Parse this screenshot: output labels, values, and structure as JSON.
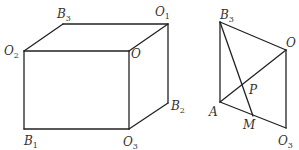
{
  "figures": [
    {
      "name": "cuboid",
      "vertices": {
        "O2": [
          24,
          51
        ],
        "B3": [
          63,
          24
        ],
        "O1": [
          168,
          24
        ],
        "O": [
          129,
          51
        ],
        "B1": [
          24,
          129
        ],
        "O3": [
          129,
          129
        ],
        "B2": [
          168,
          103
        ]
      },
      "edges": [
        [
          "O2",
          "B3"
        ],
        [
          "B3",
          "O1"
        ],
        [
          "O1",
          "O"
        ],
        [
          "O",
          "O2"
        ],
        [
          "O2",
          "B1"
        ],
        [
          "B1",
          "O3"
        ],
        [
          "O3",
          "O"
        ],
        [
          "O1",
          "B2"
        ],
        [
          "B2",
          "O3"
        ]
      ],
      "labels": [
        {
          "id": "O2",
          "base": "O",
          "sub": "2",
          "x": 4,
          "y": 55
        },
        {
          "id": "B3",
          "base": "B",
          "sub": "3",
          "x": 57,
          "y": 18
        },
        {
          "id": "O1",
          "base": "O",
          "sub": "1",
          "x": 155,
          "y": 16
        },
        {
          "id": "O",
          "base": "O",
          "sub": "",
          "x": 131,
          "y": 58
        },
        {
          "id": "B2",
          "base": "B",
          "sub": "2",
          "x": 171,
          "y": 110
        },
        {
          "id": "B1",
          "base": "B",
          "sub": "1",
          "x": 24,
          "y": 145
        },
        {
          "id": "O3",
          "base": "O",
          "sub": "3",
          "x": 123,
          "y": 146
        }
      ]
    },
    {
      "name": "section",
      "vertices": {
        "B3": [
          220,
          22
        ],
        "O": [
          286,
          50
        ],
        "A": [
          220,
          102
        ],
        "M": [
          253,
          116
        ],
        "O3": [
          286,
          128
        ],
        "P": [
          244,
          84
        ]
      },
      "edges": [
        [
          "B3",
          "O"
        ],
        [
          "B3",
          "A"
        ],
        [
          "A",
          "O3"
        ],
        [
          "O",
          "O3"
        ],
        [
          "B3",
          "M"
        ],
        [
          "A",
          "O"
        ]
      ],
      "labels": [
        {
          "id": "B3",
          "base": "B",
          "sub": "3",
          "x": 220,
          "y": 19
        },
        {
          "id": "O",
          "base": "O",
          "sub": "",
          "x": 286,
          "y": 47
        },
        {
          "id": "P",
          "base": "P",
          "sub": "",
          "x": 249,
          "y": 94
        },
        {
          "id": "A",
          "base": "A",
          "sub": "",
          "x": 209,
          "y": 116
        },
        {
          "id": "M",
          "base": "M",
          "sub": "",
          "x": 243,
          "y": 129
        },
        {
          "id": "O3",
          "base": "O",
          "sub": "3",
          "x": 278,
          "y": 145
        }
      ]
    }
  ]
}
